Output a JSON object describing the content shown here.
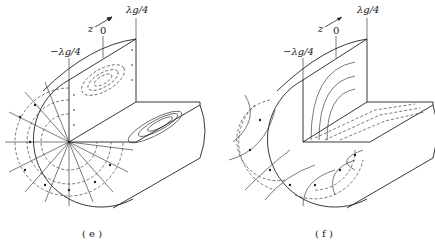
{
  "figure": {
    "type": "circular waveguide field pattern diagram",
    "panels": [
      {
        "id": "e",
        "caption": "( e )",
        "axis_label": "z",
        "markers": {
          "minus": "−λg/4",
          "zero": "0",
          "plus": "λg/4"
        },
        "description": "Cutaway cylinder; end face shows radial field lines with arrows and dashed concentric circles; longitudinal planes show closed elliptical loops (dashed/solid)."
      },
      {
        "id": "f",
        "caption": "( f )",
        "axis_label": "z",
        "markers": {
          "minus": "−λg/4",
          "zero": "0",
          "plus": "λg/4"
        },
        "description": "Cutaway cylinder; end face shows arched field lines (multiple lobes) with dashed orthogonal curves; vertical plane shows nested arches; horizontal plane shows dashed lines."
      }
    ]
  }
}
